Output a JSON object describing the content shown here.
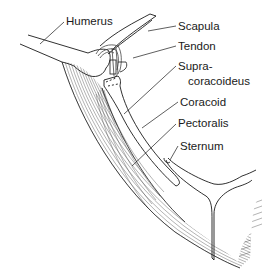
{
  "diagram": {
    "labels": {
      "humerus": "Humerus",
      "scapula": "Scapula",
      "tendon": "Tendon",
      "supra_line1": "Supra-",
      "supra_line2": "coracoideus",
      "coracoid": "Coracoid",
      "pectoralis": "Pectoralis",
      "sternum": "Sternum"
    },
    "colors": {
      "ink": "#1a1a1a",
      "muscle_hatch": "#555555",
      "background": "#ffffff"
    }
  }
}
